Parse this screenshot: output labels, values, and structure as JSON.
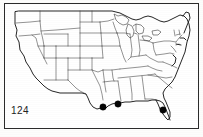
{
  "figure": {
    "label": "124",
    "caption": "",
    "region_title": "Contiguous United States",
    "frame_color": "#2b2b2b",
    "outline_color": "#1a1a1a",
    "state_border_color": "#3a3a3a",
    "dot_color": "#050505",
    "background_color": "#ffffff"
  },
  "map": {
    "projection_note": "",
    "frame": {
      "x": 4,
      "y": 3,
      "width": 194,
      "height": 125
    },
    "dot_radius": 3.2,
    "localities": [
      {
        "name": "gulf-coast-texas",
        "x": 103,
        "y": 107,
        "state": "Texas"
      },
      {
        "name": "gulf-coast-louisiana",
        "x": 118,
        "y": 104,
        "state": "Louisiana"
      },
      {
        "name": "southwest-florida",
        "x": 163,
        "y": 110,
        "state": "Florida"
      }
    ],
    "locality_count": 3
  },
  "chart_data": {
    "type": "scatter",
    "title": "124",
    "xlabel": "",
    "ylabel": "",
    "x": [
      103,
      118,
      163
    ],
    "y": [
      107,
      104,
      110
    ],
    "point_labels": [
      "Texas Gulf Coast",
      "Louisiana Gulf Coast",
      "Southwest Florida"
    ],
    "series": [
      {
        "name": "Collection localities",
        "values": [
          1,
          1,
          1
        ]
      }
    ],
    "xlim": [
      4,
      198
    ],
    "ylim": [
      128,
      3
    ],
    "grid": false,
    "legend": "none",
    "annotations": [
      "124"
    ]
  }
}
